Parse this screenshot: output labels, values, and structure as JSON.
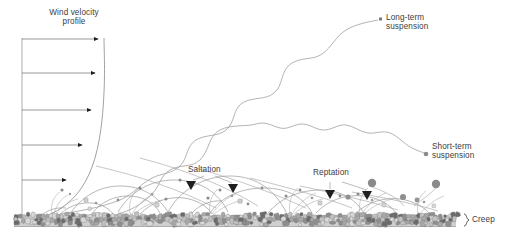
{
  "figure": {
    "type": "aeolian-sediment-transport-diagram",
    "background_color": "#ffffff",
    "line_color": "#8a8a8a",
    "text_color": "#3d3d3d"
  },
  "labels": {
    "wind_profile_line1": "Wind velocity",
    "wind_profile_line2": "profile",
    "long_term_line1": "Long-term",
    "long_term_line2": "suspension",
    "short_term_line1": "Short-term",
    "short_term_line2": "suspension",
    "saltation": "Saltation",
    "reptation": "Reptation",
    "creep": "Creep",
    "creep_brace": "}"
  },
  "chart_data": {
    "type": "diagram",
    "transport_modes": [
      {
        "name": "Long-term suspension",
        "marker": "small-square",
        "marker_color": "#7a7a7a",
        "trajectory": "stepped-wavy-ascending",
        "height_class": "highest",
        "grain_size": "finest"
      },
      {
        "name": "Short-term suspension",
        "marker": "small-circle",
        "marker_color": "#8a8a8a",
        "trajectory": "large-arc-with-oscillations",
        "height_class": "high",
        "grain_size": "fine"
      },
      {
        "name": "Saltation",
        "marker": "black-triangle",
        "marker_color": "#2b2b2b",
        "trajectory": "ballistic-hops",
        "height_class": "low",
        "grain_size": "medium"
      },
      {
        "name": "Reptation",
        "marker": "black-triangle",
        "marker_color": "#2b2b2b",
        "trajectory": "short-low-hops",
        "height_class": "very-low",
        "grain_size": "coarse"
      },
      {
        "name": "Creep",
        "marker": "curly-brace",
        "marker_color": "#3d3d3d",
        "trajectory": "rolling-along-bed",
        "height_class": "bed-surface",
        "grain_size": "coarsest"
      }
    ],
    "wind_profile": {
      "shape": "logarithmic",
      "arrow_count": 5,
      "arrow_lengths_relative": [
        1.0,
        0.92,
        0.82,
        0.68,
        0.5
      ],
      "description": "Wind speed increases with height above the bed"
    },
    "bed": {
      "description": "Dense layer of irregular grains at base",
      "grain_colors": [
        "#d8d8d8",
        "#c2c2c2",
        "#a8a8a8",
        "#8e8e8e",
        "#6a6a6a"
      ]
    }
  }
}
